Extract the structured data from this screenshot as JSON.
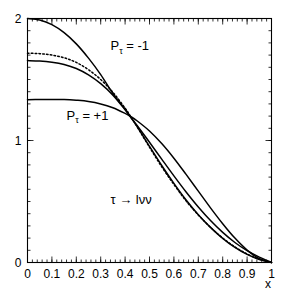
{
  "chart_data": {
    "type": "line",
    "title": "",
    "xlabel": "x",
    "ylabel": "",
    "xlim": [
      0,
      1
    ],
    "ylim": [
      0,
      2
    ],
    "grid": false,
    "legend": "none",
    "x_ticks": [
      "0",
      "0.1",
      "0.2",
      "0.3",
      "0.4",
      "0.5",
      "0.6",
      "0.7",
      "0.8",
      "0.9",
      "1"
    ],
    "x_tick_values": [
      0,
      0.1,
      0.2,
      0.3,
      0.4,
      0.5,
      0.6,
      0.7,
      0.8,
      0.9,
      1
    ],
    "y_ticks": [
      "0",
      "1",
      "2"
    ],
    "y_tick_values": [
      0,
      1,
      2
    ],
    "x_minor_tick_step": 0.02,
    "y_minor_tick_step": 0.1,
    "annotations": [
      {
        "name": "p-tau-minus-one",
        "text": "P",
        "sub": "τ",
        "rest": " = -1",
        "x": 0.34,
        "y": 1.74
      },
      {
        "name": "p-tau-plus-one",
        "text": "P",
        "sub": "τ",
        "rest": " = +1",
        "x": 0.16,
        "y": 1.17
      },
      {
        "name": "decay-channel",
        "text": "τ → lνν",
        "x": 0.34,
        "y": 0.48
      }
    ],
    "crossing_point": {
      "x": 0.42,
      "y": 1.2
    },
    "series": [
      {
        "name": "P_tau = -1",
        "style": "solid",
        "x": [
          0.0,
          0.05,
          0.1,
          0.15,
          0.2,
          0.25,
          0.3,
          0.35,
          0.4,
          0.42,
          0.45,
          0.5,
          0.55,
          0.6,
          0.65,
          0.7,
          0.75,
          0.8,
          0.85,
          0.9,
          0.95,
          1.0
        ],
        "y": [
          2.0,
          1.988,
          1.95,
          1.884,
          1.792,
          1.675,
          1.54,
          1.385,
          1.256,
          1.2,
          1.121,
          0.986,
          0.847,
          0.71,
          0.578,
          0.455,
          0.344,
          0.247,
          0.164,
          0.097,
          0.044,
          0.0
        ]
      },
      {
        "name": "unpolarized",
        "style": "dotted",
        "x": [
          0.0,
          0.05,
          0.1,
          0.15,
          0.2,
          0.25,
          0.3,
          0.35,
          0.4,
          0.42,
          0.45,
          0.5,
          0.55,
          0.6,
          0.65,
          0.7,
          0.75,
          0.8,
          0.85,
          0.9,
          0.95,
          1.0
        ],
        "y": [
          1.715,
          1.712,
          1.7,
          1.678,
          1.64,
          1.58,
          1.5,
          1.395,
          1.265,
          1.205,
          1.11,
          0.945,
          0.785,
          0.64,
          0.505,
          0.39,
          0.288,
          0.2,
          0.128,
          0.07,
          0.028,
          0.0
        ]
      },
      {
        "name": "intermediate",
        "style": "solid",
        "x": [
          0.0,
          0.05,
          0.1,
          0.15,
          0.2,
          0.25,
          0.3,
          0.35,
          0.4,
          0.42,
          0.45,
          0.5,
          0.55,
          0.6,
          0.65,
          0.7,
          0.75,
          0.8,
          0.85,
          0.9,
          0.95,
          1.0
        ],
        "y": [
          1.655,
          1.652,
          1.642,
          1.623,
          1.59,
          1.538,
          1.466,
          1.372,
          1.252,
          1.198,
          1.112,
          0.952,
          0.795,
          0.648,
          0.512,
          0.392,
          0.288,
          0.198,
          0.124,
          0.066,
          0.024,
          0.0
        ]
      },
      {
        "name": "P_tau = +1",
        "style": "solid",
        "x": [
          0.0,
          0.05,
          0.1,
          0.15,
          0.2,
          0.25,
          0.3,
          0.35,
          0.4,
          0.42,
          0.45,
          0.5,
          0.55,
          0.6,
          0.65,
          0.7,
          0.75,
          0.8,
          0.85,
          0.9,
          0.95,
          1.0
        ],
        "y": [
          1.335,
          1.336,
          1.337,
          1.336,
          1.33,
          1.32,
          1.3,
          1.268,
          1.222,
          1.2,
          1.16,
          1.078,
          0.975,
          0.855,
          0.722,
          0.585,
          0.448,
          0.318,
          0.2,
          0.102,
          0.032,
          0.0
        ]
      }
    ]
  }
}
